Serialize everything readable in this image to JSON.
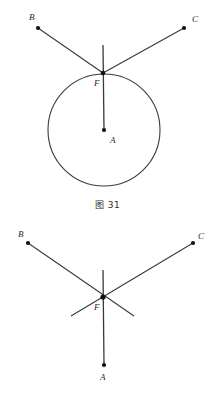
{
  "page": {
    "background_color": "#ffffff",
    "stroke_color": "#3a3a3a",
    "label_color": "#1f1f1f",
    "width": 215,
    "height": 406
  },
  "figures": [
    {
      "id": "figure-31",
      "caption": "图 31",
      "description": "Circle with center A, tangent point F on top of circle, two rays from F to B and C",
      "points": [
        {
          "name": "A",
          "label": "A",
          "x": 104,
          "y": 130
        },
        {
          "name": "B",
          "label": "B",
          "x": 38,
          "y": 28
        },
        {
          "name": "C",
          "label": "C",
          "x": 184,
          "y": 28
        },
        {
          "name": "F",
          "label": "F",
          "x": 103,
          "y": 73
        }
      ],
      "label_positions": [
        {
          "name": "A",
          "x": 110,
          "y": 143
        },
        {
          "name": "B",
          "x": 29,
          "y": 20
        },
        {
          "name": "C",
          "x": 192,
          "y": 22
        },
        {
          "name": "F",
          "x": 94,
          "y": 86
        }
      ],
      "circle": {
        "cx": 104,
        "cy": 130,
        "r": 56
      },
      "segments": [
        {
          "name": "segment-FB",
          "x1": 103,
          "y1": 73,
          "x2": 38,
          "y2": 28
        },
        {
          "name": "segment-FC",
          "x1": 103,
          "y1": 73,
          "x2": 184,
          "y2": 28
        },
        {
          "name": "segment-vertical-AF",
          "x1": 103,
          "y1": 45,
          "x2": 104,
          "y2": 130
        }
      ]
    },
    {
      "id": "figure-32",
      "caption": "图 32",
      "description": "Two crossing lines through F extending both directions, vertical line from above F down to A",
      "points": [
        {
          "name": "A",
          "label": "A",
          "x": 104,
          "y": 365
        },
        {
          "name": "B",
          "label": "B",
          "x": 28,
          "y": 243
        },
        {
          "name": "C",
          "label": "C",
          "x": 193,
          "y": 243
        },
        {
          "name": "F",
          "label": "F",
          "x": 103,
          "y": 297
        }
      ],
      "label_positions": [
        {
          "name": "A",
          "x": 100,
          "y": 380
        },
        {
          "name": "B",
          "x": 18,
          "y": 237
        },
        {
          "name": "C",
          "x": 198,
          "y": 239
        },
        {
          "name": "F",
          "x": 94,
          "y": 310
        }
      ],
      "segments": [
        {
          "name": "segment-B-through-F",
          "x1": 28,
          "y1": 243,
          "x2": 134,
          "y2": 316
        },
        {
          "name": "segment-C-through-F",
          "x1": 193,
          "y1": 243,
          "x2": 71,
          "y2": 316
        },
        {
          "name": "segment-vertical-AF",
          "x1": 103,
          "y1": 270,
          "x2": 104,
          "y2": 365
        }
      ]
    }
  ]
}
